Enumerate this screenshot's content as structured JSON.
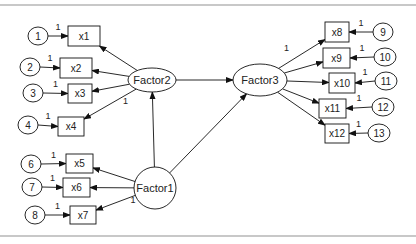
{
  "diagram": {
    "type": "structural-equation-path-diagram",
    "latent": [
      {
        "id": "F1",
        "label": "Factor1",
        "cx": 155,
        "cy": 188,
        "rx": 21,
        "ry": 21
      },
      {
        "id": "F2",
        "label": "Factor2",
        "cx": 152,
        "cy": 80,
        "rx": 24,
        "ry": 12
      },
      {
        "id": "F3",
        "label": "Factor3",
        "cx": 260,
        "cy": 80,
        "rx": 27,
        "ry": 16
      }
    ],
    "observed": [
      {
        "label": "x1",
        "x": 68,
        "y": 26,
        "w": 32,
        "h": 20,
        "factor": "F2",
        "err": "1",
        "ex": 38,
        "ey": 36
      },
      {
        "label": "x2",
        "x": 60,
        "y": 58,
        "w": 32,
        "h": 20,
        "factor": "F2",
        "err": "2",
        "ex": 30,
        "ey": 67
      },
      {
        "label": "x3",
        "x": 68,
        "y": 84,
        "w": 24,
        "h": 19,
        "factor": "F2",
        "err": "3",
        "ex": 33,
        "ey": 93
      },
      {
        "label": "x4",
        "x": 58,
        "y": 117,
        "w": 26,
        "h": 19,
        "factor": "F2",
        "err": "4",
        "ex": 28,
        "ey": 125,
        "loading": "1"
      },
      {
        "label": "x5",
        "x": 66,
        "y": 154,
        "w": 27,
        "h": 19,
        "factor": "F1",
        "err": "6",
        "ex": 31,
        "ey": 164
      },
      {
        "label": "x6",
        "x": 63,
        "y": 178,
        "w": 27,
        "h": 19,
        "factor": "F1",
        "err": "7",
        "ex": 32,
        "ey": 187
      },
      {
        "label": "x7",
        "x": 70,
        "y": 206,
        "w": 26,
        "h": 18,
        "factor": "F1",
        "err": "8",
        "ex": 35,
        "ey": 215,
        "loading": "1"
      },
      {
        "label": "x8",
        "x": 325,
        "y": 22,
        "w": 24,
        "h": 20,
        "factor": "F3",
        "err": "9",
        "ex": 383,
        "ey": 32,
        "loading": "1"
      },
      {
        "label": "x9",
        "x": 323,
        "y": 48,
        "w": 27,
        "h": 20,
        "factor": "F3",
        "err": "10",
        "ex": 385,
        "ey": 57
      },
      {
        "label": "x10",
        "x": 329,
        "y": 73,
        "w": 26,
        "h": 20,
        "factor": "F3",
        "err": "11",
        "ex": 386,
        "ey": 81
      },
      {
        "label": "x11",
        "x": 319,
        "y": 99,
        "w": 27,
        "h": 19,
        "factor": "F3",
        "err": "12",
        "ex": 383,
        "ey": 107
      },
      {
        "label": "x12",
        "x": 325,
        "y": 124,
        "w": 24,
        "h": 19,
        "factor": "F3",
        "err": "13",
        "ex": 379,
        "ey": 133
      }
    ],
    "structural_paths": [
      {
        "from": "F2",
        "to": "F3"
      },
      {
        "from": "F1",
        "to": "F2"
      },
      {
        "from": "F1",
        "to": "F3"
      }
    ],
    "error_weight_label": "1"
  }
}
